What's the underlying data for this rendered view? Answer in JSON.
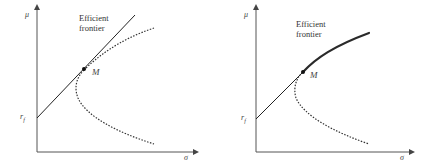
{
  "figure": {
    "panels": [
      {
        "id": "left",
        "y_axis_label": "μ",
        "x_axis_label": "σ",
        "rf_label": "r",
        "rf_subscript": "f",
        "point_label": "M",
        "annotation_line1": "Efficient",
        "annotation_line2": "frontier",
        "description": "Capital market line tangent to the minimum-variance hyperbola at market portfolio M; the straight line is labeled as the efficient frontier."
      },
      {
        "id": "right",
        "y_axis_label": "μ",
        "x_axis_label": "σ",
        "rf_label": "r",
        "rf_subscript": "f",
        "point_label": "M",
        "annotation_line1": "Efficient",
        "annotation_line2": "frontier",
        "description": "Efficient frontier composed of line segment from r_f to M followed by the thick upper branch of the hyperbola beyond M."
      }
    ],
    "colors": {
      "axis": "#555555",
      "line": "#222222",
      "dotted_curve": "#333333",
      "frontier_thick": "#2a2a2a",
      "text": "#444444"
    }
  }
}
